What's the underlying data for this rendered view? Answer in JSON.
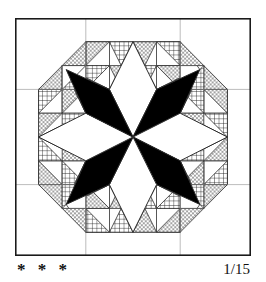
{
  "page": {
    "background_color": "#ffffff"
  },
  "block": {
    "name": "feathered-star-quilt-block",
    "frame_color": "#1a1a1a",
    "frame_line_width": 1.6,
    "fabric_colors": {
      "dark": "#000000",
      "light": "#ffffff",
      "outline": "#2b2b2b"
    },
    "textures": [
      "solid-black",
      "solid-white",
      "dotted-stipple",
      "cross-hatch"
    ],
    "center_star": {
      "type": "eight-pointed-lemoyne-star",
      "diamond_count": 8,
      "diamond_fills": [
        "light",
        "dark",
        "light",
        "dark",
        "light",
        "dark",
        "light",
        "dark"
      ]
    },
    "feathers": {
      "type": "half-square-triangle-sawtooth",
      "triangle_fills": [
        "dotted-stipple",
        "cross-hatch"
      ]
    }
  },
  "caption": {
    "difficulty_rating": "* * *",
    "difficulty_stars": 3,
    "pattern_number": "1/15"
  }
}
